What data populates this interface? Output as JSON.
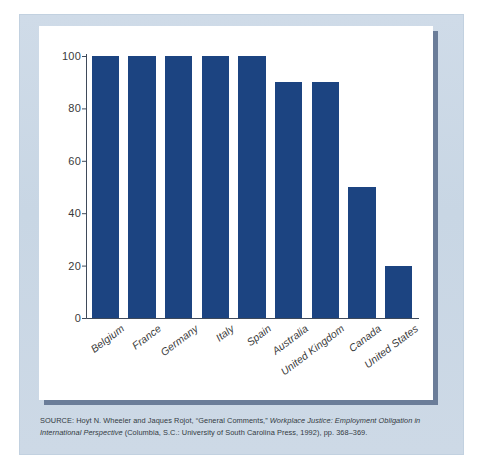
{
  "figure": {
    "background_color": "#ccd9e6",
    "card_color": "#ffffff",
    "shadow_color": "#6b7d99"
  },
  "caption": {
    "source_prefix": "SOURCE:",
    "authors": " Hoyt N. Wheeler and Jaques Rojot, ",
    "article": "“General Comments,” ",
    "book_title": "Workplace Justice: Employment Obligation in International Perspective",
    "publication": " (Columbia, S.C.: University of South Carolina Press, 1992), pp. 368–369."
  },
  "chart_data": {
    "type": "bar",
    "title": "",
    "subtitle": "",
    "xlabel": "",
    "ylabel": "",
    "categories": [
      "Belgium",
      "France",
      "Germany",
      "Italy",
      "Spain",
      "Australia",
      "United Kingdom",
      "Canada",
      "United States"
    ],
    "values": [
      100,
      100,
      100,
      100,
      100,
      90,
      90,
      50,
      20
    ],
    "ylim": [
      0,
      100
    ],
    "yticks": [
      0,
      20,
      40,
      60,
      80,
      100
    ],
    "ytick_labels": [
      "0",
      "20",
      "40",
      "60",
      "80",
      "100"
    ],
    "grid": false,
    "legend": null,
    "bar_color": "#1c4481",
    "axis_color": "#3f4a5a",
    "orientation": "vertical"
  }
}
